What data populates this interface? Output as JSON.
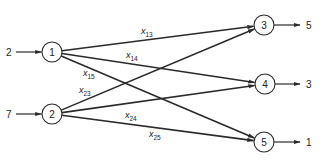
{
  "diagram": {
    "type": "transportation-network",
    "stroke_color": "#2a2a2a",
    "sources": [
      {
        "id": "1",
        "label": "1",
        "supply": "2",
        "cx": 52,
        "cy": 52
      },
      {
        "id": "2",
        "label": "2",
        "supply": "7",
        "cx": 52,
        "cy": 114
      }
    ],
    "sinks": [
      {
        "id": "3",
        "label": "3",
        "demand": "5",
        "cx": 264,
        "cy": 25
      },
      {
        "id": "4",
        "label": "4",
        "demand": "3",
        "cx": 265,
        "cy": 84
      },
      {
        "id": "5",
        "label": "5",
        "demand": "1",
        "cx": 264,
        "cy": 142
      }
    ],
    "edges": [
      {
        "from": "1",
        "to": "3",
        "var": "x",
        "sub": "13",
        "lx": 141,
        "ly": 34
      },
      {
        "from": "1",
        "to": "4",
        "var": "x",
        "sub": "14",
        "lx": 126,
        "ly": 58
      },
      {
        "from": "1",
        "to": "5",
        "var": "x",
        "sub": "15",
        "lx": 83,
        "ly": 76
      },
      {
        "from": "2",
        "to": "3",
        "var": "x",
        "sub": "23",
        "lx": 79,
        "ly": 93
      },
      {
        "from": "2",
        "to": "4",
        "var": "x",
        "sub": "24",
        "lx": 125,
        "ly": 118
      },
      {
        "from": "2",
        "to": "5",
        "var": "x",
        "sub": "25",
        "lx": 149,
        "ly": 137
      }
    ]
  }
}
